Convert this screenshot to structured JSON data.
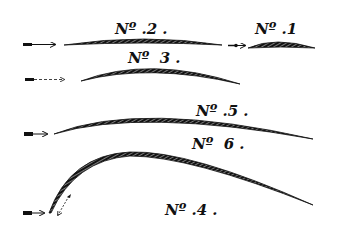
{
  "diagram": {
    "title": "",
    "colors": {
      "ink": "#111111",
      "background": "#ffffff",
      "hatch": "#e8e8e8"
    },
    "profiles": [
      {
        "id": "1",
        "label": "Nº .1",
        "label_x": 255,
        "label_y": 22
      },
      {
        "id": "2",
        "label": "Nº .2 .",
        "label_x": 115,
        "label_y": 22
      },
      {
        "id": "3",
        "label": "Nº  3 .",
        "label_x": 128,
        "label_y": 51
      },
      {
        "id": "5",
        "label": "Nº .5 .",
        "label_x": 196,
        "label_y": 104
      },
      {
        "id": "6",
        "label": "Nº  6 .",
        "label_x": 192,
        "label_y": 137
      },
      {
        "id": "4",
        "label": "Nº .4 .",
        "label_x": 165,
        "label_y": 203
      }
    ],
    "arrows": [
      {
        "for": "2",
        "direction": "right"
      },
      {
        "for": "1",
        "direction": "right"
      },
      {
        "for": "3",
        "direction": "right"
      },
      {
        "for": "5",
        "direction": "right"
      },
      {
        "for": "4-6",
        "direction": "right"
      },
      {
        "for": "4-6-deflected",
        "direction": "down-left"
      }
    ]
  }
}
